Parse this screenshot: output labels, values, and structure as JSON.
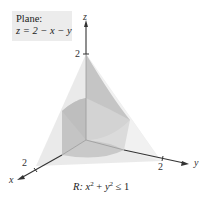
{
  "plane_label": {
    "title": "Plane:",
    "equation": "z = 2 − x − y"
  },
  "axes": {
    "x": {
      "label": "x",
      "tick": "2"
    },
    "y": {
      "label": "y",
      "tick": "2"
    },
    "z": {
      "label": "z",
      "tick": "2"
    }
  },
  "region": {
    "caption_prefix": "R:",
    "caption_expr": "x² + y² ≤ 1",
    "x_var": "x",
    "x_exp": "2",
    "plus": " + ",
    "y_var": "y",
    "y_exp": "2",
    "ineq": " ≤ 1"
  },
  "colors": {
    "plane_fill": "#e6e6e6",
    "cylinder_dark": "#b9b9b9",
    "cylinder_mid": "#cfcfcf",
    "axis": "#333333",
    "label_box": "#ececec"
  }
}
